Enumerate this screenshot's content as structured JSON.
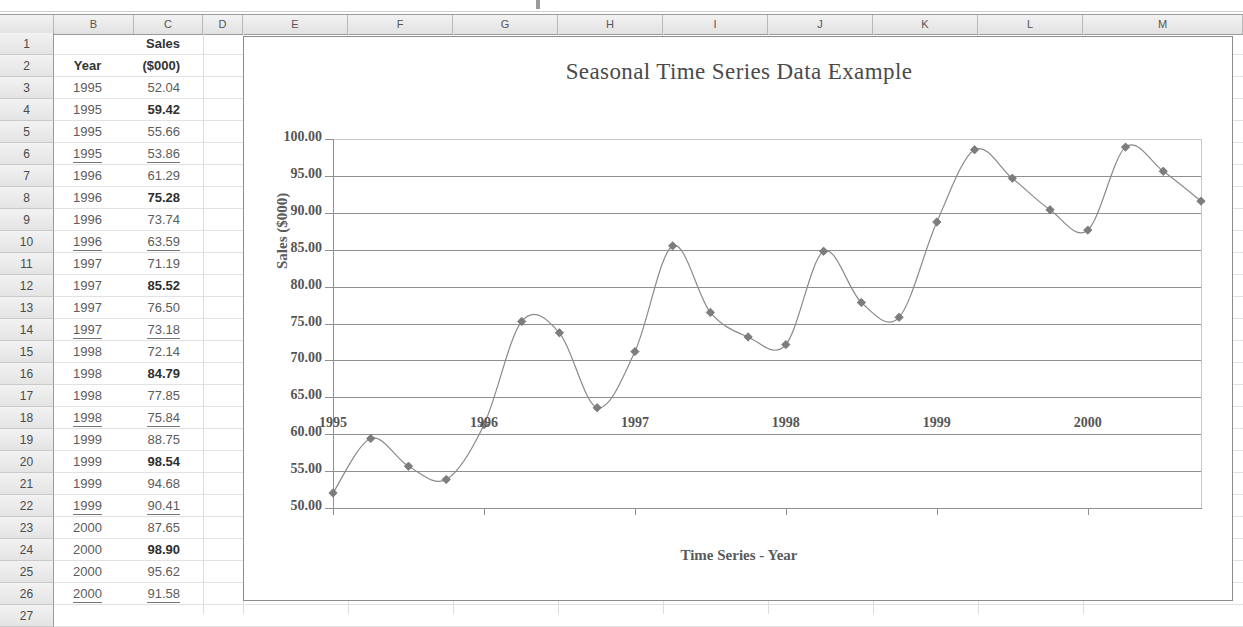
{
  "spreadsheet": {
    "column_headers": [
      "",
      "B",
      "C",
      "D",
      "E",
      "F",
      "G",
      "H",
      "I",
      "J",
      "K",
      "L",
      "M"
    ],
    "row_numbers": [
      "1",
      "2",
      "3",
      "4",
      "5",
      "6",
      "7",
      "8",
      "9",
      "10",
      "11",
      "12",
      "13",
      "14",
      "15",
      "16",
      "17",
      "18",
      "19",
      "20",
      "21",
      "22",
      "23",
      "24",
      "25",
      "26",
      "27"
    ],
    "header_rows": [
      {
        "row": "1",
        "b": "",
        "c": "Sales"
      },
      {
        "row": "2",
        "b": "Year",
        "c": "($000)"
      }
    ],
    "data_rows": [
      {
        "row": "3",
        "year": "1995",
        "sales": "52.04",
        "bold": false,
        "underline": false
      },
      {
        "row": "4",
        "year": "1995",
        "sales": "59.42",
        "bold": true,
        "underline": false
      },
      {
        "row": "5",
        "year": "1995",
        "sales": "55.66",
        "bold": false,
        "underline": false
      },
      {
        "row": "6",
        "year": "1995",
        "sales": "53.86",
        "bold": false,
        "underline": true
      },
      {
        "row": "7",
        "year": "1996",
        "sales": "61.29",
        "bold": false,
        "underline": false
      },
      {
        "row": "8",
        "year": "1996",
        "sales": "75.28",
        "bold": true,
        "underline": false
      },
      {
        "row": "9",
        "year": "1996",
        "sales": "73.74",
        "bold": false,
        "underline": false
      },
      {
        "row": "10",
        "year": "1996",
        "sales": "63.59",
        "bold": false,
        "underline": true
      },
      {
        "row": "11",
        "year": "1997",
        "sales": "71.19",
        "bold": false,
        "underline": false
      },
      {
        "row": "12",
        "year": "1997",
        "sales": "85.52",
        "bold": true,
        "underline": false
      },
      {
        "row": "13",
        "year": "1997",
        "sales": "76.50",
        "bold": false,
        "underline": false
      },
      {
        "row": "14",
        "year": "1997",
        "sales": "73.18",
        "bold": false,
        "underline": true
      },
      {
        "row": "15",
        "year": "1998",
        "sales": "72.14",
        "bold": false,
        "underline": false
      },
      {
        "row": "16",
        "year": "1998",
        "sales": "84.79",
        "bold": true,
        "underline": false
      },
      {
        "row": "17",
        "year": "1998",
        "sales": "77.85",
        "bold": false,
        "underline": false
      },
      {
        "row": "18",
        "year": "1998",
        "sales": "75.84",
        "bold": false,
        "underline": true
      },
      {
        "row": "19",
        "year": "1999",
        "sales": "88.75",
        "bold": false,
        "underline": false
      },
      {
        "row": "20",
        "year": "1999",
        "sales": "98.54",
        "bold": true,
        "underline": false
      },
      {
        "row": "21",
        "year": "1999",
        "sales": "94.68",
        "bold": false,
        "underline": false
      },
      {
        "row": "22",
        "year": "1999",
        "sales": "90.41",
        "bold": false,
        "underline": true
      },
      {
        "row": "23",
        "year": "2000",
        "sales": "87.65",
        "bold": false,
        "underline": false
      },
      {
        "row": "24",
        "year": "2000",
        "sales": "98.90",
        "bold": true,
        "underline": false
      },
      {
        "row": "25",
        "year": "2000",
        "sales": "95.62",
        "bold": false,
        "underline": false
      },
      {
        "row": "26",
        "year": "2000",
        "sales": "91.58",
        "bold": false,
        "underline": true
      }
    ]
  },
  "chart_data": {
    "type": "line",
    "title": "Seasonal Time Series Data Example",
    "xlabel": "Time Series - Year",
    "ylabel": "Sales ($000)",
    "ylim": [
      50,
      100
    ],
    "ytick_step": 5,
    "ytick_labels": [
      "100.00",
      "95.00",
      "90.00",
      "85.00",
      "80.00",
      "75.00",
      "70.00",
      "65.00",
      "60.00",
      "55.00",
      "50.00"
    ],
    "ytick_values": [
      100,
      95,
      90,
      85,
      80,
      75,
      70,
      65,
      60,
      55,
      50
    ],
    "xtick_labels": [
      "1995",
      "1996",
      "1997",
      "1998",
      "1999",
      "2000"
    ],
    "xtick_values": [
      1995,
      1996,
      1997,
      1998,
      1999,
      2000
    ],
    "xlim": [
      1995,
      2000.75
    ],
    "grid": true,
    "legend": "none",
    "marker": "diamond",
    "smoothed": true,
    "line_color": "#8a8a8a",
    "marker_color": "#7d7d7d",
    "series": [
      {
        "name": "Sales ($000)",
        "x": [
          1995.0,
          1995.25,
          1995.5,
          1995.75,
          1996.0,
          1996.25,
          1996.5,
          1996.75,
          1997.0,
          1997.25,
          1997.5,
          1997.75,
          1998.0,
          1998.25,
          1998.5,
          1998.75,
          1999.0,
          1999.25,
          1999.5,
          1999.75,
          2000.0,
          2000.25,
          2000.5,
          2000.75
        ],
        "values": [
          52.04,
          59.42,
          55.66,
          53.86,
          61.29,
          75.28,
          73.74,
          63.59,
          71.19,
          85.52,
          76.5,
          73.18,
          72.14,
          84.79,
          77.85,
          75.84,
          88.75,
          98.54,
          94.68,
          90.41,
          87.65,
          98.9,
          95.62,
          91.58
        ]
      }
    ]
  }
}
